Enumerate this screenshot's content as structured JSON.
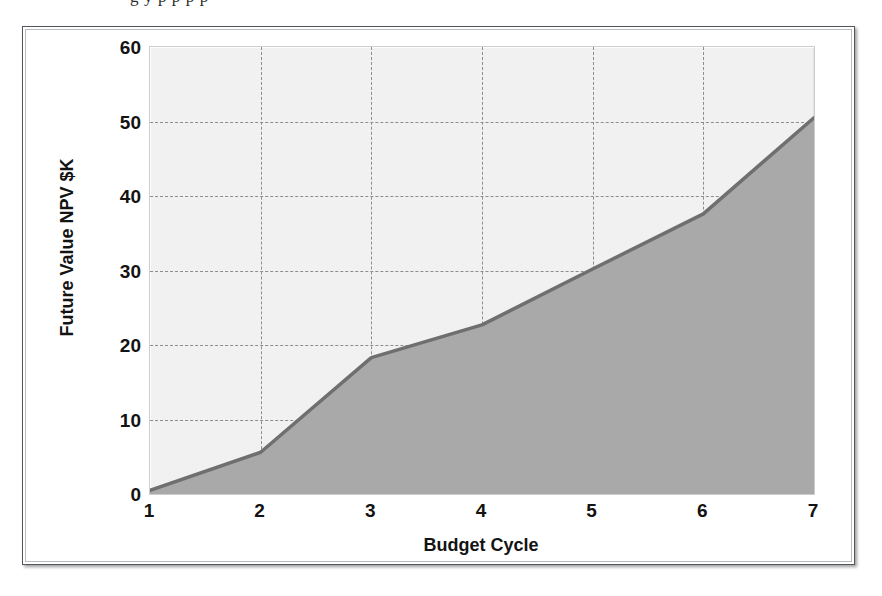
{
  "caption": {
    "clipped_text_above_figure": "g   y  p              p           p   p"
  },
  "figure": {
    "frame_style": "scanned-bordered-figure",
    "colors": {
      "plot_background": "#f1f1f1",
      "area_fill": "#a9a9a9",
      "series_line": "#6f6f6f",
      "gridline": "#8d8d8d",
      "axis_text": "#131313",
      "frame_border": "#54585c"
    }
  },
  "chart_data": {
    "type": "area",
    "title": "",
    "subtitle": "",
    "xlabel": "Budget Cycle",
    "ylabel": "Future Value NPV $K",
    "x": [
      1,
      2,
      3,
      4,
      5,
      6,
      7
    ],
    "xticklabels": [
      "1",
      "2",
      "3",
      "4",
      "5",
      "6",
      "7"
    ],
    "yticklabels": [
      "0",
      "10",
      "20",
      "30",
      "40",
      "50",
      "60"
    ],
    "yticks": [
      0,
      10,
      20,
      30,
      40,
      50,
      60
    ],
    "xlim": [
      1,
      7
    ],
    "ylim": [
      0,
      60
    ],
    "grid": true,
    "grid_style": "dashed",
    "legend": false,
    "legend_position": "none",
    "series": [
      {
        "name": "Future Value NPV $K",
        "values": [
          0.5,
          5.6,
          18.3,
          22.7,
          30.2,
          37.6,
          50.5
        ],
        "fill": true,
        "line_color": "#6f6f6f",
        "fill_color": "#a9a9a9"
      }
    ]
  }
}
